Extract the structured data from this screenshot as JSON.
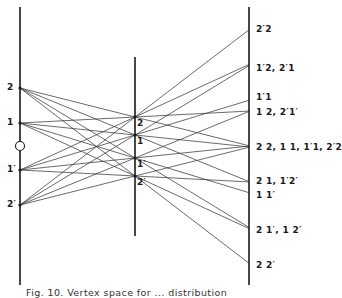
{
  "figure": {
    "caption": "Fig. 10. Vertex space for ... distribution",
    "line_color": "#3a3a3a",
    "axis_color": "#1a1a1a"
  },
  "axes": {
    "left": {
      "x": 20,
      "y_top": 7,
      "y_bottom": 285
    },
    "middle": {
      "x": 135,
      "y_top": 57,
      "y_bottom": 236
    },
    "right": {
      "x": 249,
      "y_top": 7,
      "y_bottom": 285
    }
  },
  "left_points": [
    {
      "label": "2",
      "y": 88
    },
    {
      "label": "1",
      "y": 123
    },
    {
      "label": "1′",
      "y": 170
    },
    {
      "label": "2′",
      "y": 205
    }
  ],
  "origin_marker": {
    "label": "O",
    "y": 146
  },
  "middle_points": [
    {
      "label": "2",
      "y": 117
    },
    {
      "label": "1",
      "y": 135
    },
    {
      "label": "1′",
      "y": 158
    },
    {
      "label": "2′",
      "y": 176
    }
  ],
  "right_labels": [
    {
      "label": "2′2",
      "y": 29
    },
    {
      "label": "1′2, 2′1",
      "y": 68
    },
    {
      "label": "1′1",
      "y": 97
    },
    {
      "label": "1 2, 2′1′",
      "y": 112
    },
    {
      "label": "2 2, 1 1, 1′1, 2′2",
      "y": 147
    },
    {
      "label": "2 1, 1′2′",
      "y": 181
    },
    {
      "label": "1 1′",
      "y": 195
    },
    {
      "label": "2 1′, 1 2′",
      "y": 230
    },
    {
      "label": "2 2′",
      "y": 265
    }
  ]
}
